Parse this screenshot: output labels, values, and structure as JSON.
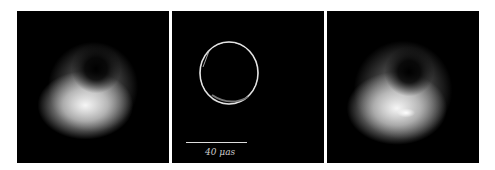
{
  "figure": {
    "panels": [
      {
        "id": "left",
        "description": "blurred crescent ring image"
      },
      {
        "id": "center",
        "description": "thin photon ring model image",
        "scale_bar": {
          "label": "40 μas"
        }
      },
      {
        "id": "right",
        "description": "blurred crescent ring image with bright spot"
      }
    ]
  }
}
